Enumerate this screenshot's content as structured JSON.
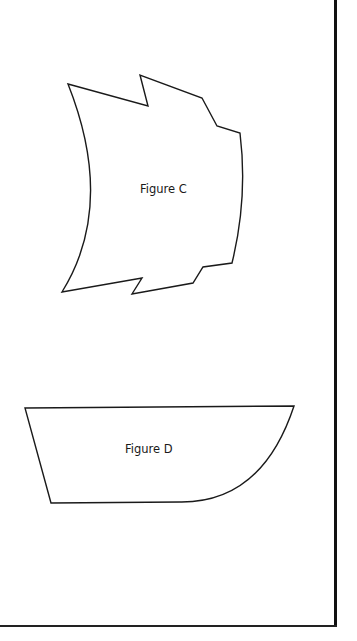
{
  "document": {
    "type": "worksheet-page",
    "figures": [
      {
        "id": "C",
        "label": "Figure C",
        "shape": "irregular-curved-polygon"
      },
      {
        "id": "D",
        "label": "Figure D",
        "shape": "trapezoid-with-curved-corner"
      }
    ]
  },
  "colors": {
    "background": "#ffffff",
    "stroke": "#1a1a1a",
    "border": "#111111"
  }
}
